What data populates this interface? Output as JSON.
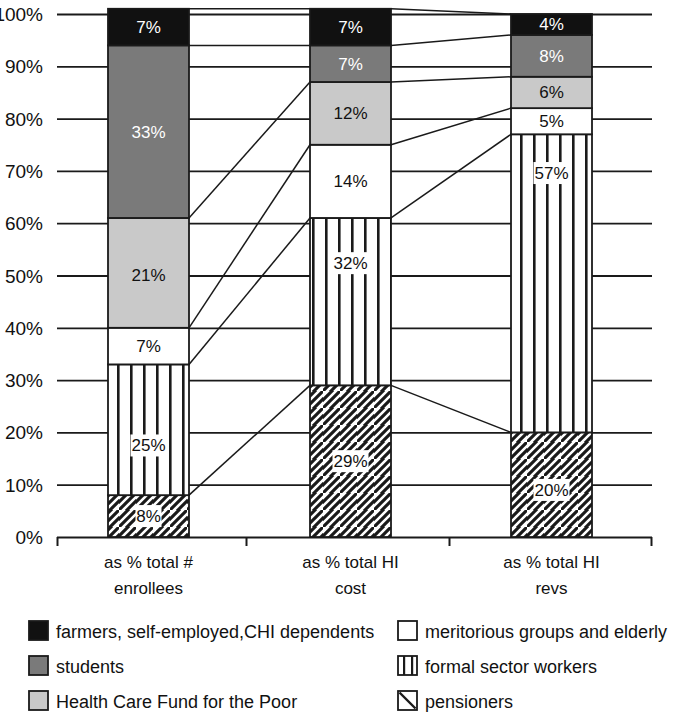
{
  "chart_data": {
    "type": "bar",
    "subtype": "stacked-100-percent",
    "title": "",
    "xlabel": "",
    "ylabel": "",
    "ylim": [
      0,
      100
    ],
    "ytick_labels": [
      "0%",
      "10%",
      "20%",
      "30%",
      "40%",
      "50%",
      "60%",
      "70%",
      "80%",
      "90%",
      "100%"
    ],
    "ytick_values": [
      0,
      10,
      20,
      30,
      40,
      50,
      60,
      70,
      80,
      90,
      100
    ],
    "grid": true,
    "legend_position": "bottom",
    "categories": [
      "as % total # enrollees",
      "as % total HI cost",
      "as % total HI revs"
    ],
    "category_lines": [
      [
        "as % total #",
        "enrollees"
      ],
      [
        "as % total HI",
        "cost"
      ],
      [
        "as % total HI",
        "revs"
      ]
    ],
    "stack_order_bottom_to_top": [
      "pensioners",
      "formal sector workers",
      "meritorious groups and elderly",
      "Health Care Fund for the Poor",
      "students",
      "farmers, self-employed,CHI dependents"
    ],
    "series": [
      {
        "name": "pensioners",
        "pattern": "diagonal-hatch",
        "fill": "#ffffff",
        "values": [
          8,
          29,
          20
        ],
        "labels": [
          "8%",
          "29%",
          "20%"
        ]
      },
      {
        "name": "formal sector workers",
        "pattern": "vertical-lines",
        "fill": "#ffffff",
        "values": [
          25,
          32,
          57
        ],
        "labels": [
          "25%",
          "32%",
          "57%"
        ]
      },
      {
        "name": "meritorious groups and elderly",
        "pattern": "solid",
        "fill": "#ffffff",
        "values": [
          7,
          14,
          5
        ],
        "labels": [
          "7%",
          "14%",
          "5%"
        ]
      },
      {
        "name": "Health Care Fund for the Poor",
        "pattern": "solid",
        "fill": "#c9c9c9",
        "values": [
          21,
          12,
          6
        ],
        "labels": [
          "21%",
          "12%",
          "6%"
        ]
      },
      {
        "name": "students",
        "pattern": "solid",
        "fill": "#7a7a7a",
        "values": [
          33,
          7,
          8
        ],
        "labels": [
          "33%",
          "7%",
          "8%"
        ]
      },
      {
        "name": "farmers, self-employed,CHI dependents",
        "pattern": "solid",
        "fill": "#111111",
        "values": [
          7,
          7,
          4
        ],
        "labels": [
          "7%",
          "7%",
          "4%"
        ]
      }
    ]
  },
  "axis": {
    "y_ticks": [
      {
        "label": "100%",
        "value": 100
      },
      {
        "label": "90%",
        "value": 90
      },
      {
        "label": "80%",
        "value": 80
      },
      {
        "label": "70%",
        "value": 70
      },
      {
        "label": "60%",
        "value": 60
      },
      {
        "label": "50%",
        "value": 50
      },
      {
        "label": "40%",
        "value": 40
      },
      {
        "label": "30%",
        "value": 30
      },
      {
        "label": "20%",
        "value": 20
      },
      {
        "label": "10%",
        "value": 10
      },
      {
        "label": "0%",
        "value": 0
      }
    ]
  },
  "legend": {
    "left_column": [
      {
        "label": "farmers, self-employed,CHI dependents",
        "swatch": "black-solid-swatch"
      },
      {
        "label": "students",
        "swatch": "dark-gray-solid-swatch"
      },
      {
        "label": "Health Care Fund for the Poor",
        "swatch": "light-gray-solid-swatch"
      }
    ],
    "right_column": [
      {
        "label": "meritorious groups and elderly",
        "swatch": "white-solid-swatch"
      },
      {
        "label": "formal sector workers",
        "swatch": "vertical-lines-swatch"
      },
      {
        "label": "pensioners",
        "swatch": "diagonal-line-swatch"
      }
    ]
  },
  "colors": {
    "black": "#111111",
    "dark_gray": "#7a7a7a",
    "light_gray": "#c9c9c9",
    "white": "#ffffff",
    "line": "#1a1a1a"
  }
}
